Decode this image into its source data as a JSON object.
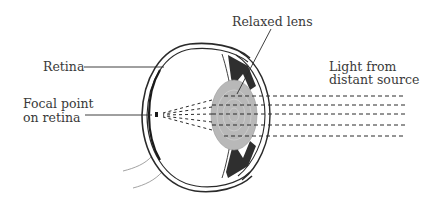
{
  "labels": {
    "retina": "Retina",
    "focal_point_line1": "Focal point",
    "focal_point_line2": "on retina",
    "relaxed_lens": "Relaxed lens",
    "light_line1": "Light from",
    "light_line2": "distant source"
  },
  "colors": {
    "outline": "#2a2a2a",
    "lens_fill": "#b8b8b8",
    "muscle_fill": "#2f2f2f",
    "text": "#3a3a3a"
  },
  "rays": {
    "count": 5,
    "style": "dashed",
    "converge_to": "focal point on retina"
  }
}
